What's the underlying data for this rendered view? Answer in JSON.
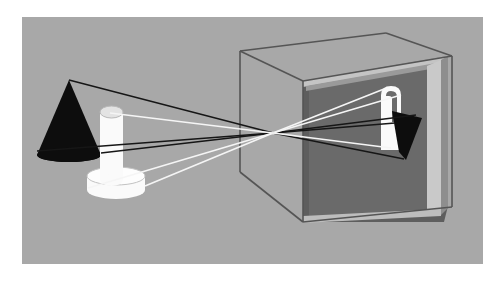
{
  "figure": {
    "width": 501,
    "height": 283,
    "page_background": "#ffffff"
  },
  "scene": {
    "backdrop": {
      "label": "scene-backdrop",
      "fill": "#a8a8a8",
      "x": 22,
      "y": 17,
      "width": 461,
      "height": 247
    },
    "colors": {
      "backdrop_gray": "#a8a8a8",
      "box_face_gray": "#a4a4a4",
      "box_interior_dark": "#5e5e5e",
      "box_edge_line": "#555555",
      "frame_light": "#c9c9c9",
      "frame_mid": "#8f8f8f",
      "object_black": "#0d0d0d",
      "object_white": "#fafafa",
      "ray_black": "#161616",
      "ray_white": "#f5f5f5"
    }
  },
  "objects": [
    {
      "id": "cone",
      "name": "black-cone",
      "description": "Solid black cone standing at left, apex up",
      "fill": "#0d0d0d",
      "apex": {
        "x": 69,
        "y": 80
      },
      "base_left": {
        "x": 37,
        "y": 155
      },
      "base_right": {
        "x": 101,
        "y": 155
      },
      "base_ellipse_ry": 7
    },
    {
      "id": "cylinder",
      "name": "white-cylinder",
      "description": "White cylinder standing on a white disc base",
      "fill": "#fafafa",
      "left": 100,
      "right": 123,
      "top_y": 112,
      "bottom_y": 180,
      "cap_ellipse_ry": 6
    },
    {
      "id": "disc",
      "name": "white-disc-base",
      "description": "Wide flat white disc the cylinder rests on",
      "fill": "#fafafa",
      "cx": 116,
      "cy": 176,
      "rx": 29,
      "ry": 9,
      "thickness": 16
    }
  ],
  "camera_box": {
    "name": "pinhole-camera-box",
    "description": "Open cube representing the camera obscura; dark interior back wall acts as the projection screen",
    "front_face": {
      "top_left": {
        "x": 240,
        "y": 51
      },
      "top_right": {
        "x": 240,
        "y": 51
      },
      "x": 240,
      "y_top": 51,
      "y_bottom": 172
    },
    "top_back_edge": {
      "left_x": 302,
      "right_x": 448,
      "y": 38
    },
    "interior": {
      "fill": "#5e5e5e",
      "left": 302,
      "right": 444,
      "top": 81,
      "bottom": 222
    },
    "screen_panel": {
      "name": "projection-screen",
      "fill": "#6b6b6b",
      "left": 309,
      "right": 430,
      "top": 87,
      "bottom": 216
    }
  },
  "pinhole": {
    "name": "pinhole-aperture",
    "description": "Convergence point where all rays cross",
    "x": 273,
    "y": 133
  },
  "projected_images": [
    {
      "id": "cone-image",
      "name": "inverted-cone-image",
      "description": "Inverted black cone image on the back screen, apex pointing down",
      "fill": "#0d0d0d",
      "apex": {
        "x": 404,
        "y": 159
      },
      "base_left": {
        "x": 392,
        "y": 112
      },
      "base_right": {
        "x": 421,
        "y": 119
      }
    },
    {
      "id": "cylinder-image",
      "name": "inverted-cylinder-image",
      "description": "Inverted white cylinder image with its disc base at the top",
      "fill": "#fafafa",
      "left": 381,
      "right": 401,
      "top": 86,
      "bottom": 150
    }
  ],
  "rays": {
    "black_rays": {
      "name": "cone-light-rays",
      "color": "#161616",
      "description": "Rays traced from the cone through the pinhole to the inverted cone image",
      "paths": [
        {
          "from": {
            "x": 69,
            "y": 80
          },
          "via": {
            "x": 273,
            "y": 133
          },
          "to": {
            "x": 404,
            "y": 159
          }
        },
        {
          "from": {
            "x": 101,
            "y": 155
          },
          "via": {
            "x": 273,
            "y": 133
          },
          "to": {
            "x": 415,
            "y": 116
          }
        },
        {
          "from": {
            "x": 37,
            "y": 152
          },
          "via": {
            "x": 273,
            "y": 133
          },
          "to": {
            "x": 396,
            "y": 112
          }
        }
      ]
    },
    "white_rays": {
      "name": "cylinder-light-rays",
      "color": "#f5f5f5",
      "description": "Rays traced from the cylinder through the pinhole to the inverted cylinder image",
      "paths": [
        {
          "from": {
            "x": 110,
            "y": 113
          },
          "via": {
            "x": 273,
            "y": 133
          },
          "to": {
            "x": 391,
            "y": 148
          }
        },
        {
          "from": {
            "x": 145,
            "y": 185
          },
          "via": {
            "x": 273,
            "y": 133
          },
          "to": {
            "x": 385,
            "y": 89
          }
        },
        {
          "from": {
            "x": 88,
            "y": 186
          },
          "via": {
            "x": 273,
            "y": 133
          },
          "to": {
            "x": 399,
            "y": 92
          }
        }
      ]
    }
  }
}
